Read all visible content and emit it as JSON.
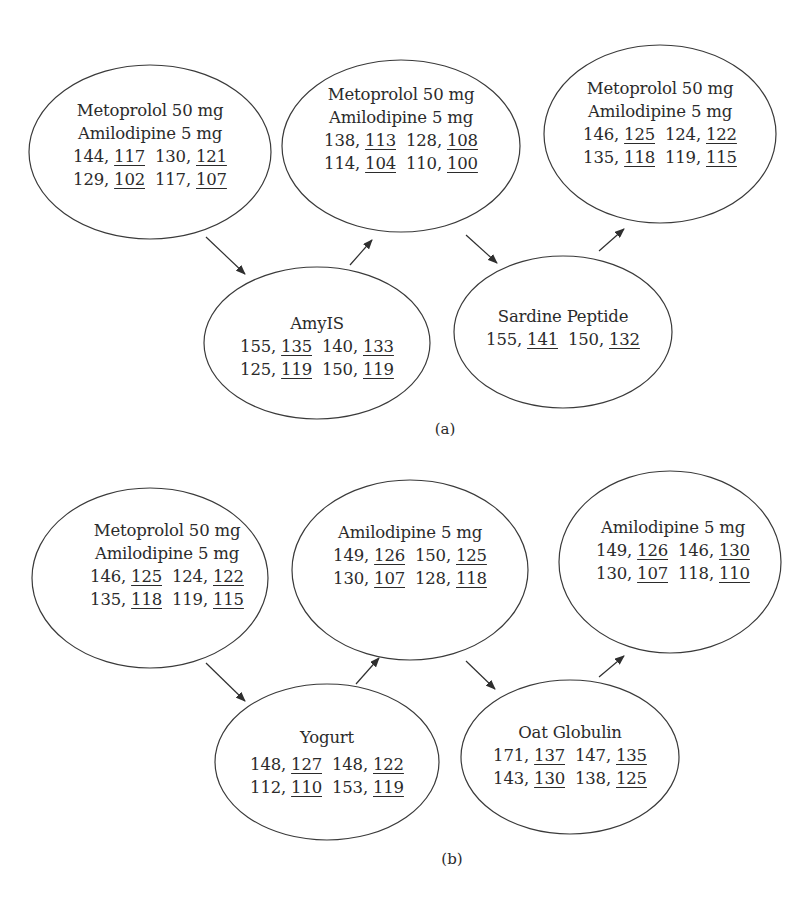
{
  "panels": [
    {
      "label": "(a)",
      "nodes": [
        {
          "title_lines": [
            "Metoprolol 50 mg",
            "Amilodipine 5 mg"
          ],
          "rows": [
            [
              {
                "a": "144,",
                "b": "117"
              },
              {
                "a": "130,",
                "b": "121"
              }
            ],
            [
              {
                "a": "129,",
                "b": "102"
              },
              {
                "a": "117,",
                "b": "107"
              }
            ]
          ]
        },
        {
          "title_lines": [
            "Metoprolol 50 mg",
            "Amilodipine 5 mg"
          ],
          "rows": [
            [
              {
                "a": "138,",
                "b": "113"
              },
              {
                "a": "128,",
                "b": "108"
              }
            ],
            [
              {
                "a": "114,",
                "b": "104"
              },
              {
                "a": "110,",
                "b": "100"
              }
            ]
          ]
        },
        {
          "title_lines": [
            "Metoprolol 50 mg",
            "Amilodipine 5 mg"
          ],
          "rows": [
            [
              {
                "a": "146,",
                "b": "125"
              },
              {
                "a": "124,",
                "b": "122"
              }
            ],
            [
              {
                "a": "135,",
                "b": "118"
              },
              {
                "a": "119,",
                "b": "115"
              }
            ]
          ]
        },
        {
          "title_lines": [
            "AmyIS"
          ],
          "rows": [
            [
              {
                "a": "155,",
                "b": "135"
              },
              {
                "a": "140,",
                "b": "133"
              }
            ],
            [
              {
                "a": "125,",
                "b": "119"
              },
              {
                "a": "150,",
                "b": "119"
              }
            ]
          ]
        },
        {
          "title_lines": [
            "Sardine Peptide"
          ],
          "rows": [
            [
              {
                "a": "155,",
                "b": "141"
              },
              {
                "a": "150,",
                "b": "132"
              }
            ]
          ]
        }
      ]
    },
    {
      "label": "(b)",
      "nodes": [
        {
          "title_lines": [
            "Metoprolol 50 mg",
            "Amilodipine 5 mg"
          ],
          "rows": [
            [
              {
                "a": "146,",
                "b": "125"
              },
              {
                "a": "124,",
                "b": "122"
              }
            ],
            [
              {
                "a": "135,",
                "b": "118"
              },
              {
                "a": "119,",
                "b": "115"
              }
            ]
          ]
        },
        {
          "title_lines": [
            "Amilodipine 5 mg"
          ],
          "rows": [
            [
              {
                "a": "149,",
                "b": "126"
              },
              {
                "a": "150,",
                "b": "125"
              }
            ],
            [
              {
                "a": "130,",
                "b": "107"
              },
              {
                "a": "128,",
                "b": "118"
              }
            ]
          ]
        },
        {
          "title_lines": [
            "Amilodipine 5 mg"
          ],
          "rows": [
            [
              {
                "a": "149,",
                "b": "126"
              },
              {
                "a": "146,",
                "b": "130"
              }
            ],
            [
              {
                "a": "130,",
                "b": "107"
              },
              {
                "a": "118,",
                "b": "110"
              }
            ]
          ]
        },
        {
          "title_lines": [
            "Yogurt"
          ],
          "rows": [
            [
              {
                "a": "148,",
                "b": "127"
              },
              {
                "a": "148,",
                "b": "122"
              }
            ],
            [
              {
                "a": "112,",
                "b": "110"
              },
              {
                "a": "153,",
                "b": "119"
              }
            ]
          ]
        },
        {
          "title_lines": [
            "Oat Globulin"
          ],
          "rows": [
            [
              {
                "a": "171,",
                "b": "137"
              },
              {
                "a": "147,",
                "b": "135"
              }
            ],
            [
              {
                "a": "143,",
                "b": "130"
              },
              {
                "a": "138,",
                "b": "125"
              }
            ]
          ]
        }
      ]
    }
  ],
  "flow": {
    "a": [
      "Metoprolol 50 mg + Amilodipine 5 mg",
      "AmyIS",
      "Metoprolol 50 mg + Amilodipine 5 mg",
      "Sardine Peptide",
      "Metoprolol 50 mg + Amilodipine 5 mg"
    ],
    "b": [
      "Metoprolol 50 mg + Amilodipine 5 mg",
      "Yogurt",
      "Amilodipine 5 mg",
      "Oat Globulin",
      "Amilodipine 5 mg"
    ]
  },
  "colors": {
    "stroke": "#3a3a3a",
    "text": "#2b2b2b",
    "background": "#ffffff"
  }
}
